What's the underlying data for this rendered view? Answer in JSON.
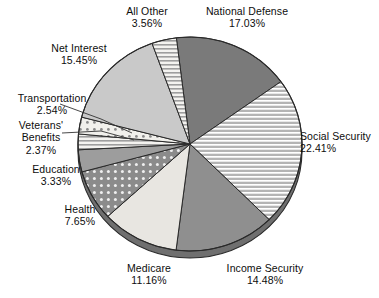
{
  "chart_data": {
    "type": "pie",
    "title": "",
    "subtitle": "",
    "xlabel": "",
    "ylabel": "",
    "legend_position": "none",
    "grid": false,
    "units": "percent",
    "value_suffix": "%",
    "total": 100.0,
    "start_angle_deg": -7,
    "direction": "clockwise",
    "categories": [
      "National Defense",
      "Social Security",
      "Income Security",
      "Medicare",
      "Health",
      "Education",
      "Veterans' Benefits",
      "Transportation",
      "Net Interest",
      "All Other"
    ],
    "values": [
      17.03,
      22.41,
      14.48,
      11.16,
      7.65,
      3.33,
      2.37,
      2.54,
      15.45,
      3.56
    ],
    "slices": [
      {
        "id": "national-defense",
        "label": "National Defense",
        "value": 17.03,
        "value_text": "17.03%",
        "fill": "#7a7a7a",
        "pattern": "solid",
        "label_lines": [
          "National Defense",
          "17.03%"
        ]
      },
      {
        "id": "social-security",
        "label": "Social Security",
        "value": 22.41,
        "value_text": "22.41%",
        "fill": "#a8a8a8",
        "pattern": "horizontal-lines",
        "label_lines": [
          "Social Security",
          "22.41%"
        ]
      },
      {
        "id": "income-security",
        "label": "Income Security",
        "value": 14.48,
        "value_text": "14.48%",
        "fill": "#8f8f8f",
        "pattern": "solid",
        "label_lines": [
          "Income Security",
          "14.48%"
        ]
      },
      {
        "id": "medicare",
        "label": "Medicare",
        "value": 11.16,
        "value_text": "11.16%",
        "fill": "#e8e6e1",
        "pattern": "solid",
        "label_lines": [
          "Medicare",
          "11.16%"
        ]
      },
      {
        "id": "health",
        "label": "Health",
        "value": 7.65,
        "value_text": "7.65%",
        "fill": "#8b8b8b",
        "pattern": "dots",
        "label_lines": [
          "Health",
          "7.65%"
        ]
      },
      {
        "id": "education",
        "label": "Education",
        "value": 3.33,
        "value_text": "3.33%",
        "fill": "#9d9d9d",
        "pattern": "solid",
        "label_lines": [
          "Education",
          "3.33%"
        ]
      },
      {
        "id": "veterans-benefits",
        "label": "Veterans' Benefits",
        "value": 2.37,
        "value_text": "2.37%",
        "fill": "#f2f1ee",
        "pattern": "horizontal-lines-light",
        "label_lines": [
          "Veterans'",
          "Benefits",
          "2.37%"
        ]
      },
      {
        "id": "transportation",
        "label": "Transportation",
        "value": 2.54,
        "value_text": "2.54%",
        "fill": "#efeeea",
        "pattern": "dots-light",
        "label_lines": [
          "Transportation",
          "2.54%"
        ]
      },
      {
        "id": "net-interest",
        "label": "Net Interest",
        "value": 15.45,
        "value_text": "15.45%",
        "fill": "#c9c9c9",
        "pattern": "solid",
        "label_lines": [
          "Net Interest",
          "15.45%"
        ]
      },
      {
        "id": "all-other",
        "label": "All Other",
        "value": 3.56,
        "value_text": "3.56%",
        "fill": "#dedede",
        "pattern": "horizontal-lines-light",
        "label_lines": [
          "All Other",
          "3.56%"
        ]
      }
    ],
    "style": {
      "three_d_rim": true,
      "rim_color": "#6f6f6f",
      "outline_color": "#2a2a2a",
      "background": "#ffffff",
      "leader_line_color": "#333333"
    }
  },
  "labels": {
    "national_defense": {
      "name": "National Defense",
      "pct": "17.03%"
    },
    "social_security": {
      "name": "Social Security",
      "pct": "22.41%"
    },
    "income_security": {
      "name": "Income Security",
      "pct": "14.48%"
    },
    "medicare": {
      "name": "Medicare",
      "pct": "11.16%"
    },
    "health": {
      "name": "Health",
      "pct": "7.65%"
    },
    "education": {
      "name": "Education",
      "pct": "3.33%"
    },
    "veterans": {
      "name": "Veterans'",
      "name2": "Benefits",
      "pct": "2.37%"
    },
    "transportation": {
      "name": "Transportation",
      "pct": "2.54%"
    },
    "net_interest": {
      "name": "Net Interest",
      "pct": "15.45%"
    },
    "all_other": {
      "name": "All Other",
      "pct": "3.56%"
    }
  }
}
